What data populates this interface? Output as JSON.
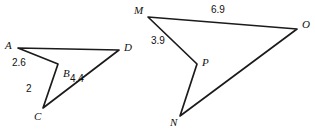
{
  "figure": {
    "kind": "geometry-diagram",
    "stroke_color": "#1b1b1b",
    "background_color": "#ffffff",
    "text_color": "#111111",
    "shapes": [
      {
        "id": "left-quadrilateral",
        "name": "ABCD",
        "vertices": [
          {
            "label": "A",
            "x": 18,
            "y": 48,
            "label_x": 5,
            "label_y": 40
          },
          {
            "label": "B",
            "x": 58,
            "y": 64,
            "label_x": 63,
            "label_y": 68
          },
          {
            "label": "C",
            "x": 43,
            "y": 108,
            "label_x": 34,
            "label_y": 111
          },
          {
            "label": "D",
            "x": 119,
            "y": 50,
            "label_x": 124,
            "label_y": 42
          }
        ],
        "path": "A-B-C-D-A",
        "measures": [
          {
            "value": "2.6",
            "edge": "A-B",
            "label_x": 12,
            "label_y": 58
          },
          {
            "value": "2",
            "edge": "B-C",
            "label_x": 26,
            "label_y": 84
          },
          {
            "value": "4.4",
            "edge": "C-D",
            "label_x": 70,
            "label_y": 74
          }
        ]
      },
      {
        "id": "right-quadrilateral",
        "name": "MPNO",
        "vertices": [
          {
            "label": "M",
            "x": 148,
            "y": 17,
            "label_x": 134,
            "label_y": 5
          },
          {
            "label": "P",
            "x": 197,
            "y": 64,
            "label_x": 202,
            "label_y": 57
          },
          {
            "label": "N",
            "x": 180,
            "y": 116,
            "label_x": 170,
            "label_y": 117
          },
          {
            "label": "O",
            "x": 297,
            "y": 29,
            "label_x": 302,
            "label_y": 19
          }
        ],
        "path": "M-P-N-O-M",
        "measures": [
          {
            "value": "3.9",
            "edge": "M-P",
            "label_x": 151,
            "label_y": 36
          },
          {
            "value": "6.9",
            "edge": "M-O",
            "label_x": 211,
            "label_y": 5
          }
        ]
      }
    ]
  }
}
